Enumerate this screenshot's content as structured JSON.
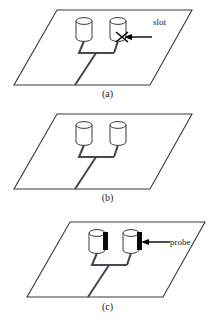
{
  "figure": {
    "type": "technical-line-diagram",
    "stroke_color": "#3a3a42",
    "accent_color": "#000000",
    "background_color": "#ffffff"
  },
  "panels": [
    {
      "id": "a",
      "caption": "(a)",
      "annotation": {
        "label": "slot",
        "marker": "x-cross",
        "arrow": "left"
      },
      "cylinders": 2,
      "feed": "microstrip"
    },
    {
      "id": "b",
      "caption": "(b)",
      "annotation": null,
      "cylinders": 2,
      "feed": "microstrip"
    },
    {
      "id": "c",
      "caption": "(c)",
      "annotation": {
        "label": "probe",
        "marker": "filled-bar",
        "arrow": "left"
      },
      "cylinders": 2,
      "feed": "microstrip"
    }
  ],
  "captions": {
    "a": "(a)",
    "b": "(b)",
    "c": "(c)"
  },
  "labels": {
    "slot": "slot",
    "probe": "probe"
  }
}
